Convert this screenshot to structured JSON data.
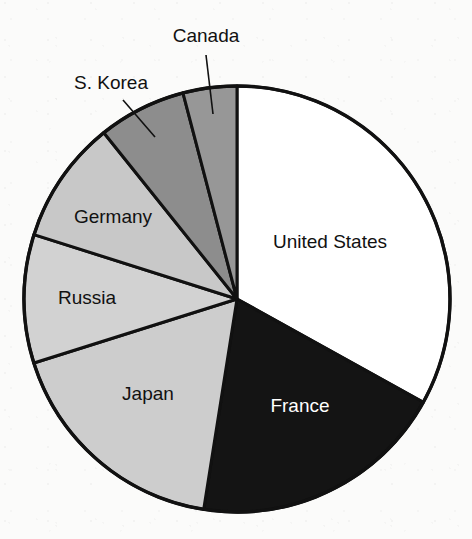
{
  "figure": {
    "background_color": "#fbfbfa",
    "outline_color": "#111111"
  },
  "chart_data": {
    "type": "pie",
    "title": "",
    "subtitle": "",
    "xlabel": "",
    "ylabel": "",
    "legend_position": "none",
    "grid": false,
    "label_style": "on-slice with leader lines for small slices",
    "start_angle_deg": 0,
    "direction": "clockwise",
    "center": {
      "x": 237,
      "y": 299
    },
    "radius": 213,
    "categories": [
      "United States",
      "France",
      "Japan",
      "Russia",
      "Germany",
      "S. Korea",
      "Canada"
    ],
    "values": [
      33.1,
      19.4,
      17.6,
      9.8,
      9.4,
      6.7,
      4.1
    ],
    "units": "percent",
    "slices": [
      {
        "label": "United States",
        "value": 33.1,
        "start_deg": 0.0,
        "end_deg": 119.0,
        "sweep_deg": 119.0,
        "fill": "#ffffff",
        "label_fill": "#111111",
        "label_x": 330,
        "label_y": 248,
        "label_anchor": "middle",
        "callout": false
      },
      {
        "label": "France",
        "value": 19.4,
        "start_deg": 119.0,
        "end_deg": 189.0,
        "sweep_deg": 70.0,
        "fill": "#141414",
        "label_fill": "#ffffff",
        "label_x": 300,
        "label_y": 412,
        "label_anchor": "middle",
        "callout": false
      },
      {
        "label": "Japan",
        "value": 17.6,
        "start_deg": 189.0,
        "end_deg": 252.5,
        "sweep_deg": 63.5,
        "fill": "#cdcdcd",
        "label_fill": "#111111",
        "label_x": 148,
        "label_y": 400,
        "label_anchor": "middle",
        "callout": false
      },
      {
        "label": "Russia",
        "value": 9.8,
        "start_deg": 252.5,
        "end_deg": 287.6,
        "sweep_deg": 35.1,
        "fill": "#d2d2d2",
        "label_fill": "#111111",
        "label_x": 87,
        "label_y": 304,
        "label_anchor": "middle",
        "callout": false
      },
      {
        "label": "Germany",
        "value": 9.4,
        "start_deg": 287.6,
        "end_deg": 321.3,
        "sweep_deg": 33.7,
        "fill": "#c8c8c8",
        "label_fill": "#111111",
        "label_x": 113,
        "label_y": 223,
        "label_anchor": "middle",
        "callout": false
      },
      {
        "label": "S. Korea",
        "value": 6.7,
        "start_deg": 321.3,
        "end_deg": 345.3,
        "sweep_deg": 24.0,
        "fill": "#8d8d8d",
        "label_fill": "#111111",
        "label_x": 111,
        "label_y": 89,
        "label_anchor": "middle",
        "callout": true,
        "leader": {
          "x1": 123,
          "y1": 100,
          "x2": 155,
          "y2": 137
        }
      },
      {
        "label": "Canada",
        "value": 4.1,
        "start_deg": 345.3,
        "end_deg": 360.0,
        "sweep_deg": 14.7,
        "fill": "#979797",
        "label_fill": "#111111",
        "label_x": 206,
        "label_y": 42,
        "label_anchor": "middle",
        "callout": true,
        "leader": {
          "x1": 206,
          "y1": 55,
          "x2": 213,
          "y2": 114
        }
      }
    ]
  }
}
